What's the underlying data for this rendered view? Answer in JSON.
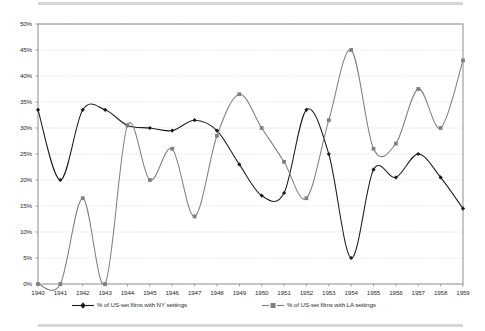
{
  "chart_data": {
    "type": "line",
    "title": "",
    "xlabel": "",
    "ylabel": "",
    "xlim": [
      1940,
      1959
    ],
    "ylim": [
      0,
      50
    ],
    "grid": true,
    "grid_axis": "y",
    "legend_position": "bottom",
    "categories": [
      "1940",
      "1941",
      "1942",
      "1943",
      "1944",
      "1945",
      "1946",
      "1947",
      "1948",
      "1949",
      "1950",
      "1951",
      "1952",
      "1953",
      "1954",
      "1955",
      "1956",
      "1957",
      "1958",
      "1959"
    ],
    "x": [
      1940,
      1941,
      1942,
      1943,
      1944,
      1945,
      1946,
      1947,
      1948,
      1949,
      1950,
      1951,
      1952,
      1953,
      1954,
      1955,
      1956,
      1957,
      1958,
      1959
    ],
    "ytick_labels": [
      "50%",
      "45%",
      "40%",
      "35%",
      "30%",
      "25%",
      "20%",
      "15%",
      "10%",
      "5%",
      "0%"
    ],
    "ytick_values": [
      50,
      45,
      40,
      35,
      30,
      25,
      20,
      15,
      10,
      5,
      0
    ],
    "xtick_labels": [
      "1940",
      "1941",
      "1942",
      "1943",
      "1944",
      "1945",
      "1946",
      "1947",
      "1948",
      "1949",
      "1950",
      "1951",
      "1952",
      "1953",
      "1954",
      "1955",
      "1956",
      "1957",
      "1958",
      "1959"
    ],
    "series": [
      {
        "name": "% of US-set films with NY settings",
        "color": "#1c1c1c",
        "marker": "diamond",
        "values": [
          33.5,
          20.0,
          33.5,
          33.5,
          30.5,
          30.0,
          29.5,
          31.5,
          29.5,
          23.0,
          17.0,
          17.5,
          33.5,
          25.0,
          5.0,
          22.0,
          20.5,
          25.0,
          20.5,
          14.5
        ]
      },
      {
        "name": "% of US-set films with LA settings",
        "color": "#808080",
        "marker": "square",
        "values": [
          0.0,
          0.0,
          16.5,
          0.0,
          30.5,
          20.0,
          26.0,
          13.0,
          28.5,
          36.5,
          30.0,
          23.5,
          16.5,
          31.5,
          45.0,
          26.0,
          27.0,
          37.5,
          30.0,
          43.0
        ]
      }
    ]
  },
  "legend": {
    "entries": [
      {
        "label": "% of US-set films with NY settings",
        "marker": "diamond-marker-icon",
        "color": "#1c1c1c"
      },
      {
        "label": "% of US-set films with LA settings",
        "marker": "square-marker-icon",
        "color": "#808080"
      }
    ]
  },
  "colors": {
    "ny_series": "#1c1c1c",
    "la_series": "#808080",
    "gridline": "#c8c8dc",
    "axis": "#808080",
    "page_rule": "#d8d8d8",
    "text": "#2b2b2b"
  }
}
